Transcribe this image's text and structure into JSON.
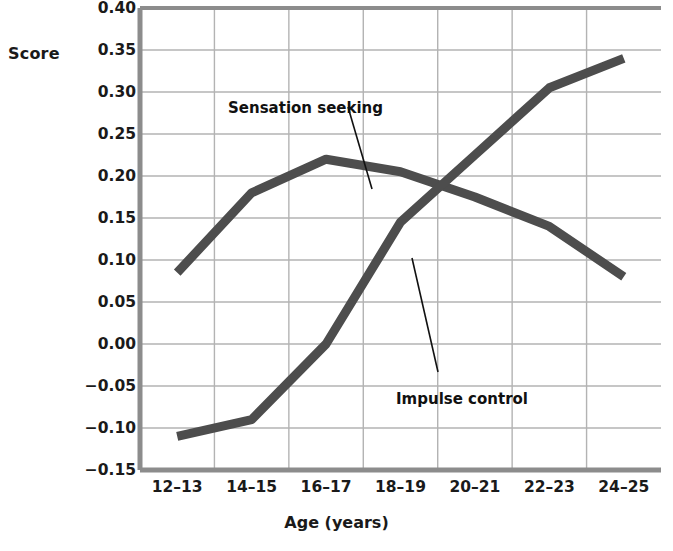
{
  "chart_data": {
    "type": "line",
    "title": "",
    "subtitle": "",
    "xlabel": "Age (years)",
    "ylabel": "Score",
    "categories": [
      "12–13",
      "14–15",
      "16–17",
      "18–19",
      "20–21",
      "22–23",
      "24–25"
    ],
    "ylim": [
      -0.15,
      0.4
    ],
    "ytick_labels": [
      "0.40",
      "0.35",
      "0.30",
      "0.25",
      "0.20",
      "0.15",
      "0.10",
      "0.05",
      "0.00",
      "−0.05",
      "−0.10",
      "−0.15"
    ],
    "ytick_values": [
      0.4,
      0.35,
      0.3,
      0.25,
      0.2,
      0.15,
      0.1,
      0.05,
      0.0,
      -0.05,
      -0.1,
      -0.15
    ],
    "grid": true,
    "legend_position": "annotations-on-plot",
    "series": [
      {
        "name": "Sensation seeking",
        "color": "#4d4d4d",
        "values": [
          0.085,
          0.18,
          0.22,
          0.205,
          0.175,
          0.14,
          0.08
        ]
      },
      {
        "name": "Impulse control",
        "color": "#4d4d4d",
        "values": [
          -0.11,
          -0.09,
          0.0,
          0.145,
          0.225,
          0.305,
          0.34
        ]
      }
    ],
    "annotations": [
      {
        "name": "Sensation seeking",
        "text": "Sensation seeking",
        "label_x": 228,
        "label_y": 99,
        "leader_from_x": 348,
        "leader_from_y": 107,
        "leader_to_x": 372,
        "leader_to_y": 189
      },
      {
        "name": "Impulse control",
        "text": "Impulse control",
        "label_x": 396,
        "label_y": 390,
        "leader_from_x": 438,
        "leader_from_y": 372,
        "leader_to_x": 412,
        "leader_to_y": 258
      }
    ],
    "colors": {
      "line": "#4d4d4d",
      "grid": "#b3b3b3",
      "axis": "#8c8c8c",
      "background": "#ffffff",
      "text": "#1a1a1a"
    }
  }
}
